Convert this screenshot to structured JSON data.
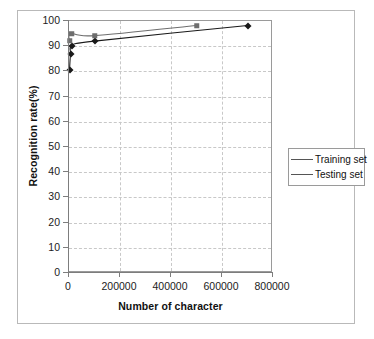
{
  "chart_data": {
    "type": "line",
    "title": "",
    "xlabel": "Number of character",
    "ylabel": "Recognition rate(%)",
    "xlim": [
      0,
      800000
    ],
    "ylim": [
      0,
      100
    ],
    "xticks": [
      0,
      200000,
      400000,
      600000,
      800000
    ],
    "xtick_labels": [
      "0",
      "200000",
      "400000",
      "600000",
      "800000"
    ],
    "yticks": [
      0,
      10,
      20,
      30,
      40,
      50,
      60,
      70,
      80,
      90,
      100
    ],
    "ytick_labels": [
      "0",
      "10",
      "20",
      "30",
      "40",
      "50",
      "60",
      "70",
      "80",
      "90",
      "100"
    ],
    "grid": true,
    "grid_style": "dashed",
    "legend_position": "right",
    "series": [
      {
        "name": "Training set",
        "marker": "diamond",
        "color": "#1a1a1a",
        "x": [
          2000,
          6000,
          12000,
          100000,
          700000
        ],
        "y": [
          80.5,
          87.0,
          90.2,
          92.0,
          98.2
        ]
      },
      {
        "name": "Testing set",
        "marker": "square",
        "color": "#6e6e6e",
        "x": [
          2000,
          8000,
          100000,
          500000
        ],
        "y": [
          92.2,
          95.0,
          94.2,
          98.2
        ]
      }
    ]
  },
  "axis": {
    "x_title": "Number of character",
    "y_title": "Recognition rate(%)",
    "x_tick_labels": [
      "0",
      "200000",
      "400000",
      "600000",
      "800000"
    ],
    "y_tick_labels": [
      "100",
      "90",
      "80",
      "70",
      "60",
      "50",
      "40",
      "30",
      "20",
      "10",
      "0"
    ]
  },
  "legend": {
    "items": [
      {
        "label": "Training set",
        "marker": "diamond-marker-icon"
      },
      {
        "label": "Testing set",
        "marker": "square-marker-icon"
      }
    ]
  },
  "colors": {
    "training": "#1a1a1a",
    "testing": "#6e6e6e",
    "grid": "#c8c8c8",
    "axis": "#7d7d7d",
    "frame": "#b9b9b9",
    "background": "#ffffff"
  }
}
